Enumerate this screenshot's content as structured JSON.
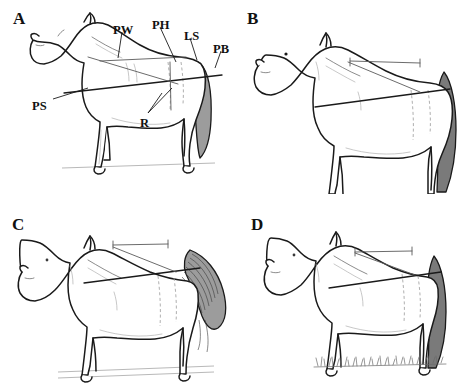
{
  "figure": {
    "background_color": "#ffffff",
    "line_color": "#1a1a1a",
    "shade_color": "#9c9c9c",
    "panel_count": 4,
    "layout": "2x2 grid"
  },
  "panels": [
    {
      "id": "a",
      "letter": "A",
      "subject": "horse-lateral-view-with-measurement-labels",
      "tail_style": "short-grey-shaded-tail",
      "ground_style": "faint-ground-line",
      "has_labels": true,
      "labels": [
        {
          "key": "PW",
          "text": "PW",
          "name": "label-pw",
          "x": 113,
          "y": 24,
          "leader": true
        },
        {
          "key": "PH",
          "text": "PH",
          "name": "label-ph",
          "x": 152,
          "y": 19,
          "leader": true
        },
        {
          "key": "LS",
          "text": "LS",
          "name": "label-ls",
          "x": 184,
          "y": 30,
          "leader": true
        },
        {
          "key": "PB",
          "text": "PB",
          "name": "label-pb",
          "x": 213,
          "y": 43,
          "leader": true
        },
        {
          "key": "PS",
          "text": "PS",
          "name": "label-ps",
          "x": 32,
          "y": 100,
          "leader": true
        },
        {
          "key": "R",
          "text": "R",
          "name": "label-r",
          "x": 140,
          "y": 117,
          "leader": true
        }
      ],
      "measurement_lines": [
        {
          "name": "body-length-line",
          "type": "horizontal",
          "from": [
            64,
            93
          ],
          "to": [
            222,
            75
          ]
        },
        {
          "name": "diagonal-girth-line",
          "type": "diagonal",
          "from": [
            88,
            57
          ],
          "to": [
            178,
            84
          ]
        },
        {
          "name": "topline-segment",
          "type": "topline",
          "from": [
            100,
            61
          ],
          "to": [
            186,
            57
          ]
        }
      ]
    },
    {
      "id": "b",
      "letter": "B",
      "subject": "horse-lateral-view-plain",
      "tail_style": "long-dark-grey-tail",
      "ground_style": "none",
      "has_labels": false,
      "labels": [],
      "measurement_lines": [
        {
          "name": "body-length-line",
          "type": "horizontal",
          "from": [
            315,
            107
          ],
          "to": [
            450,
            89
          ]
        },
        {
          "name": "diagonal-girth-line",
          "type": "diagonal",
          "from": [
            348,
            62
          ],
          "to": [
            420,
            92
          ]
        },
        {
          "name": "topline-segment",
          "type": "topline",
          "from": [
            350,
            62
          ],
          "to": [
            420,
            63
          ]
        }
      ]
    },
    {
      "id": "c",
      "letter": "C",
      "subject": "horse-lateral-view-flowing-tail",
      "tail_style": "long-striated-flowing-tail",
      "ground_style": "faint-ground-line",
      "has_labels": false,
      "labels": [],
      "measurement_lines": [
        {
          "name": "body-length-line",
          "type": "horizontal",
          "from": [
            84,
            283
          ],
          "to": [
            200,
            268
          ]
        },
        {
          "name": "diagonal-girth-line",
          "type": "diagonal",
          "from": [
            113,
            247
          ],
          "to": [
            176,
            272
          ]
        },
        {
          "name": "topline-segment",
          "type": "topline",
          "from": [
            113,
            247
          ],
          "to": [
            168,
            245
          ]
        }
      ]
    },
    {
      "id": "d",
      "letter": "D",
      "subject": "horse-lateral-view-standing-in-grass",
      "tail_style": "dark-narrow-tail",
      "ground_style": "grass-tufts",
      "has_labels": false,
      "labels": [],
      "measurement_lines": [
        {
          "name": "body-length-line",
          "type": "horizontal",
          "from": [
            329,
            288
          ],
          "to": [
            441,
            272
          ]
        },
        {
          "name": "diagonal-girth-line",
          "type": "diagonal",
          "from": [
            355,
            253
          ],
          "to": [
            415,
            275
          ]
        },
        {
          "name": "topline-segment",
          "type": "topline",
          "from": [
            355,
            253
          ],
          "to": [
            412,
            252
          ]
        }
      ]
    }
  ],
  "abbreviations": {
    "PW": "PW",
    "PH": "PH",
    "LS": "LS",
    "PB": "PB",
    "PS": "PS",
    "R": "R"
  },
  "panel_letters": {
    "a": "A",
    "b": "B",
    "c": "C",
    "d": "D"
  }
}
